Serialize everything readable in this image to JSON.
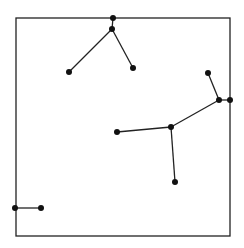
{
  "diagram": {
    "type": "graph-in-square",
    "frame": {
      "x1": 16,
      "y1": 18,
      "x2": 230,
      "y2": 236,
      "stroke": "#222222"
    },
    "node_color": "#111111",
    "edge_color": "#222222",
    "nodes": [
      {
        "id": "A",
        "x": 113,
        "y": 18
      },
      {
        "id": "B",
        "x": 112,
        "y": 29
      },
      {
        "id": "C",
        "x": 69,
        "y": 72
      },
      {
        "id": "D",
        "x": 133,
        "y": 68
      },
      {
        "id": "E",
        "x": 208,
        "y": 73
      },
      {
        "id": "F",
        "x": 219,
        "y": 100
      },
      {
        "id": "G",
        "x": 230,
        "y": 100
      },
      {
        "id": "H",
        "x": 171,
        "y": 127
      },
      {
        "id": "I",
        "x": 117,
        "y": 132
      },
      {
        "id": "J",
        "x": 175,
        "y": 182
      },
      {
        "id": "K",
        "x": 15,
        "y": 208
      },
      {
        "id": "L",
        "x": 41,
        "y": 208
      }
    ],
    "edges": [
      [
        "A",
        "B"
      ],
      [
        "B",
        "C"
      ],
      [
        "B",
        "D"
      ],
      [
        "E",
        "F"
      ],
      [
        "F",
        "G"
      ],
      [
        "F",
        "H"
      ],
      [
        "H",
        "I"
      ],
      [
        "H",
        "J"
      ],
      [
        "K",
        "L"
      ]
    ]
  }
}
